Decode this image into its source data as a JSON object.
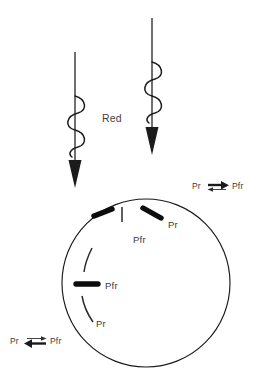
{
  "figure": {
    "background_color": "#ffffff",
    "ink_color": "#1b1b1b",
    "text_color": "#3a3a3a"
  },
  "light": {
    "label": "Red",
    "ray_count": 2,
    "rays": [
      {
        "name": "left-red-ray",
        "description": "wavy red light ray pointing down"
      },
      {
        "name": "right-red-ray",
        "description": "wavy red light ray pointing down"
      }
    ]
  },
  "cell": {
    "name": "cell-outline",
    "shape": "circle"
  },
  "molecules": {
    "pr_label": "Pr",
    "pfr_label": "Pfr",
    "items": [
      {
        "id": "pfr-top-left",
        "form": "Pfr",
        "label": "Pfr",
        "style": "thick"
      },
      {
        "id": "pr-top-center",
        "form": "Pr",
        "label": "Pr",
        "style": "thin"
      },
      {
        "id": "pfr-top-right",
        "form": "Pfr",
        "label": "Pr",
        "style": "thick"
      },
      {
        "id": "pr-left-upper",
        "form": "Pr",
        "label": "",
        "style": "thin"
      },
      {
        "id": "pfr-left-mid",
        "form": "Pfr",
        "label": "Pfr",
        "style": "thick"
      },
      {
        "id": "pr-left-lower",
        "form": "Pr",
        "label": "Pr",
        "style": "thin"
      }
    ]
  },
  "equilibria": [
    {
      "id": "equilibrium-top-right",
      "left_label": "Pr",
      "right_label": "Pfr",
      "dominant_direction": "forward",
      "description": "Pr converts to Pfr, forward arrow bold"
    },
    {
      "id": "equilibrium-bottom-left",
      "left_label": "Pr",
      "right_label": "Pfr",
      "dominant_direction": "reverse",
      "description": "Pfr reverts to Pr, reverse arrow bold"
    }
  ],
  "labels": {
    "interior_pfr_top": "Pfr",
    "interior_pr_top_right": "Pr",
    "interior_pfr_mid": "Pfr",
    "interior_pr_lower": "Pr"
  }
}
